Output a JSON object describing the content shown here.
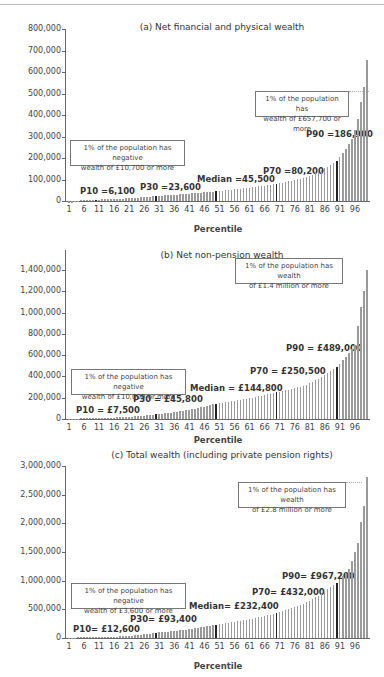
{
  "chart_data": [
    {
      "type": "bar",
      "title": "(a) Net financial and physical wealth",
      "xlabel": "Percentile",
      "ylabel": "",
      "ylim": [
        0,
        800000
      ],
      "yticks": [
        "0",
        "100,000",
        "200,000",
        "300,000",
        "400,000",
        "500,000",
        "600,000",
        "700,000",
        "800,000"
      ],
      "ytick_values": [
        0,
        100000,
        200000,
        300000,
        400000,
        500000,
        600000,
        700000,
        800000
      ],
      "xticks": [
        "1",
        "6",
        "11",
        "16",
        "21",
        "26",
        "31",
        "36",
        "41",
        "46",
        "51",
        "56",
        "61",
        "66",
        "71",
        "76",
        "81",
        "86",
        "91",
        "96"
      ],
      "grid": false,
      "highlighted_percentiles": [
        10,
        30,
        50,
        70,
        90
      ],
      "anchors": {
        "1": -10700,
        "5": 0,
        "10": 6100,
        "30": 23600,
        "50": 45500,
        "70": 80200,
        "80": 110000,
        "90": 186900,
        "95": 290000,
        "97": 380000,
        "98": 460000,
        "99": 530000,
        "100": 657700
      },
      "annotations": [
        {
          "label": "P10 =6,100",
          "percentile": 10,
          "value": 6100
        },
        {
          "label": "P30 =23,600",
          "percentile": 30,
          "value": 23600
        },
        {
          "label": "Median =45,500",
          "percentile": 50,
          "value": 45500
        },
        {
          "label": "P70 =80,200",
          "percentile": 70,
          "value": 80200
        },
        {
          "label": "P90 =186,900",
          "percentile": 90,
          "value": 186900
        }
      ],
      "boxes": [
        {
          "lines": [
            "1% of the population has negative",
            "wealth of £10,700 or more"
          ]
        },
        {
          "lines": [
            "1% of the population has",
            "wealth of £657,700 or more"
          ]
        }
      ]
    },
    {
      "type": "bar",
      "title": "(b) Net non-pension wealth",
      "xlabel": "Percentile",
      "ylabel": "",
      "ylim": [
        0,
        1400000
      ],
      "yticks": [
        "0",
        "200,000",
        "400,000",
        "600,000",
        "800,000",
        "1,000,000",
        "1,200,000",
        "1,400,000"
      ],
      "ytick_values": [
        0,
        200000,
        400000,
        600000,
        800000,
        1000000,
        1200000,
        1400000
      ],
      "xticks": [
        "1",
        "6",
        "11",
        "16",
        "21",
        "26",
        "31",
        "36",
        "41",
        "46",
        "51",
        "56",
        "61",
        "66",
        "71",
        "76",
        "81",
        "86",
        "91",
        "96"
      ],
      "grid": false,
      "highlighted_percentiles": [
        30,
        50,
        70,
        90
      ],
      "anchors": {
        "1": -10000,
        "5": 0,
        "10": 7500,
        "30": 45800,
        "50": 144800,
        "70": 250500,
        "80": 320000,
        "90": 489000,
        "94": 620000,
        "96": 700000,
        "97": 870000,
        "98": 1050000,
        "99": 1200000,
        "100": 1400000
      },
      "annotations": [
        {
          "label": "P10 = £7,500",
          "percentile": 10,
          "value": 7500
        },
        {
          "label": "P30 = £45,800",
          "percentile": 30,
          "value": 45800
        },
        {
          "label": "Median = £144,800",
          "percentile": 50,
          "value": 144800
        },
        {
          "label": "P70 = £250,500",
          "percentile": 70,
          "value": 250500
        },
        {
          "label": "P90 = £489,000",
          "percentile": 90,
          "value": 489000
        }
      ],
      "boxes": [
        {
          "lines": [
            "1% of the population has negative",
            "wealth of £10,000 or more"
          ]
        },
        {
          "lines": [
            "1% of the population has wealth",
            "of £1.4 million or more"
          ]
        }
      ]
    },
    {
      "type": "bar",
      "title": "(c) Total wealth (including private pension rights)",
      "xlabel": "Percentile",
      "ylabel": "",
      "ylim": [
        0,
        3000000
      ],
      "yticks": [
        "0",
        "500,000",
        "1,000,000",
        "1,500,000",
        "2,000,000",
        "2,500,000",
        "3,000,000"
      ],
      "ytick_values": [
        0,
        500000,
        1000000,
        1500000,
        2000000,
        2500000,
        3000000
      ],
      "xticks": [
        "1",
        "6",
        "11",
        "16",
        "21",
        "26",
        "31",
        "36",
        "41",
        "46",
        "51",
        "56",
        "61",
        "66",
        "71",
        "76",
        "81",
        "86",
        "91",
        "96"
      ],
      "grid": false,
      "highlighted_percentiles": [
        30,
        50,
        70,
        90
      ],
      "anchors": {
        "1": -3600,
        "4": 0,
        "10": 12600,
        "30": 93400,
        "50": 232400,
        "70": 432000,
        "80": 620000,
        "90": 967200,
        "94": 1200000,
        "96": 1500000,
        "97": 1650000,
        "98": 2030000,
        "99": 2300000,
        "100": 2800000
      },
      "annotations": [
        {
          "label": "P10=  £12,600",
          "percentile": 10,
          "value": 12600
        },
        {
          "label": "P30= £93,400",
          "percentile": 30,
          "value": 93400
        },
        {
          "label": "Median= £232,400",
          "percentile": 50,
          "value": 232400
        },
        {
          "label": "P70= £432,000",
          "percentile": 70,
          "value": 432000
        },
        {
          "label": "P90= £967,200",
          "percentile": 90,
          "value": 967200
        }
      ],
      "boxes": [
        {
          "lines": [
            "1% of the population has negative",
            "wealth of £3,600 or more"
          ]
        },
        {
          "lines": [
            "1% of the population has wealth",
            "of £2.8 million or more"
          ]
        }
      ]
    }
  ]
}
